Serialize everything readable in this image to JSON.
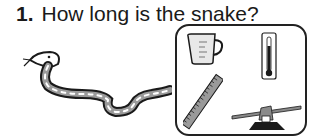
{
  "question": {
    "number": "1.",
    "text": "How long is the snake?"
  },
  "illustration": {
    "subject": "snake"
  },
  "choices": [
    {
      "name": "measuring-cup",
      "label": "measuring cup"
    },
    {
      "name": "thermometer",
      "label": "thermometer"
    },
    {
      "name": "ruler",
      "label": "ruler"
    },
    {
      "name": "balance-scale",
      "label": "balance scale"
    }
  ],
  "colors": {
    "ink": "#1a1a1a",
    "shade": "#9a9a9a",
    "background": "#ffffff"
  }
}
